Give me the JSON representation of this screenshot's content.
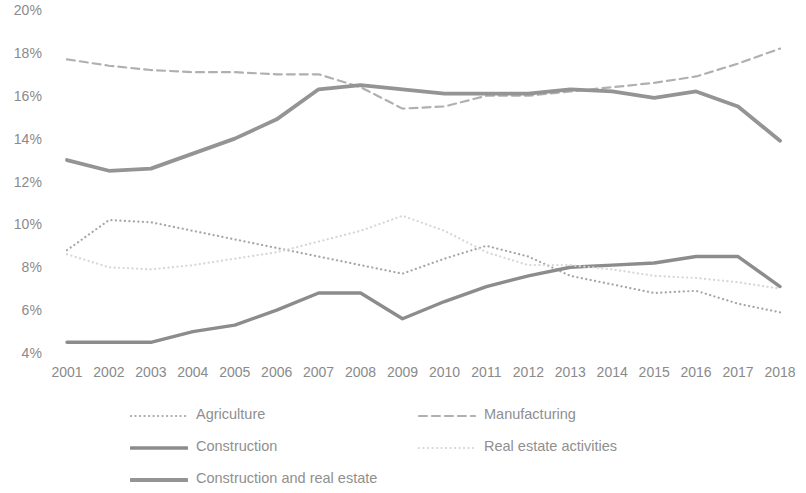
{
  "chart_data": {
    "type": "line",
    "title": "",
    "xlabel": "",
    "ylabel": "",
    "x": [
      2001,
      2002,
      2003,
      2004,
      2005,
      2006,
      2007,
      2008,
      2009,
      2010,
      2011,
      2012,
      2013,
      2014,
      2015,
      2016,
      2017,
      2018
    ],
    "categories": [
      "2001",
      "2002",
      "2003",
      "2004",
      "2005",
      "2006",
      "2007",
      "2008",
      "2009",
      "2010",
      "2011",
      "2012",
      "2013",
      "2014",
      "2015",
      "2016",
      "2017",
      "2018"
    ],
    "ylim": [
      4,
      20
    ],
    "y_ticks": [
      4,
      6,
      8,
      10,
      12,
      14,
      16,
      18,
      20
    ],
    "y_tick_labels": [
      "4%",
      "6%",
      "8%",
      "10%",
      "12%",
      "14%",
      "16%",
      "18%",
      "20%"
    ],
    "grid": false,
    "legend_position": "bottom",
    "value_suffix": "%",
    "series": [
      {
        "name": "Agriculture",
        "style": "dotted",
        "color": "#a6a6a6",
        "width": 2.2,
        "values": [
          8.8,
          10.2,
          10.1,
          9.7,
          9.3,
          8.9,
          8.5,
          8.1,
          7.7,
          8.4,
          9.0,
          8.5,
          7.6,
          7.2,
          6.8,
          6.9,
          6.3,
          5.9
        ]
      },
      {
        "name": "Manufacturing",
        "style": "dashed",
        "color": "#b0b0b0",
        "width": 2.2,
        "values": [
          17.7,
          17.4,
          17.2,
          17.1,
          17.1,
          17.0,
          17.0,
          16.4,
          15.4,
          15.5,
          16.0,
          16.0,
          16.2,
          16.4,
          16.6,
          16.9,
          17.5,
          18.2
        ]
      },
      {
        "name": "Construction",
        "style": "solid",
        "color": "#8c8c8c",
        "width": 3.4,
        "values": [
          4.5,
          4.5,
          4.5,
          5.0,
          5.3,
          6.0,
          6.8,
          6.8,
          5.6,
          6.4,
          7.1,
          7.6,
          8.0,
          8.1,
          8.2,
          8.5,
          8.5,
          7.1
        ]
      },
      {
        "name": "Real estate activities",
        "style": "dotted-light",
        "color": "#d6d6d6",
        "width": 2.2,
        "values": [
          8.6,
          8.0,
          7.9,
          8.1,
          8.4,
          8.7,
          9.2,
          9.7,
          10.4,
          9.7,
          8.7,
          8.1,
          8.1,
          7.9,
          7.6,
          7.5,
          7.3,
          7.0
        ]
      },
      {
        "name": "Construction and real estate",
        "style": "solid",
        "color": "#949494",
        "width": 3.8,
        "values": [
          13.0,
          12.5,
          12.6,
          13.3,
          14.0,
          14.9,
          16.3,
          16.5,
          16.3,
          16.1,
          16.1,
          16.1,
          16.3,
          16.2,
          15.9,
          16.2,
          15.5,
          13.9
        ]
      }
    ]
  },
  "legend": {
    "entries": [
      {
        "label": "Agriculture",
        "series_index": 0
      },
      {
        "label": "Manufacturing",
        "series_index": 1
      },
      {
        "label": "Construction",
        "series_index": 2
      },
      {
        "label": "Real estate activities",
        "series_index": 3
      },
      {
        "label": "Construction and real estate",
        "series_index": 4
      }
    ]
  }
}
